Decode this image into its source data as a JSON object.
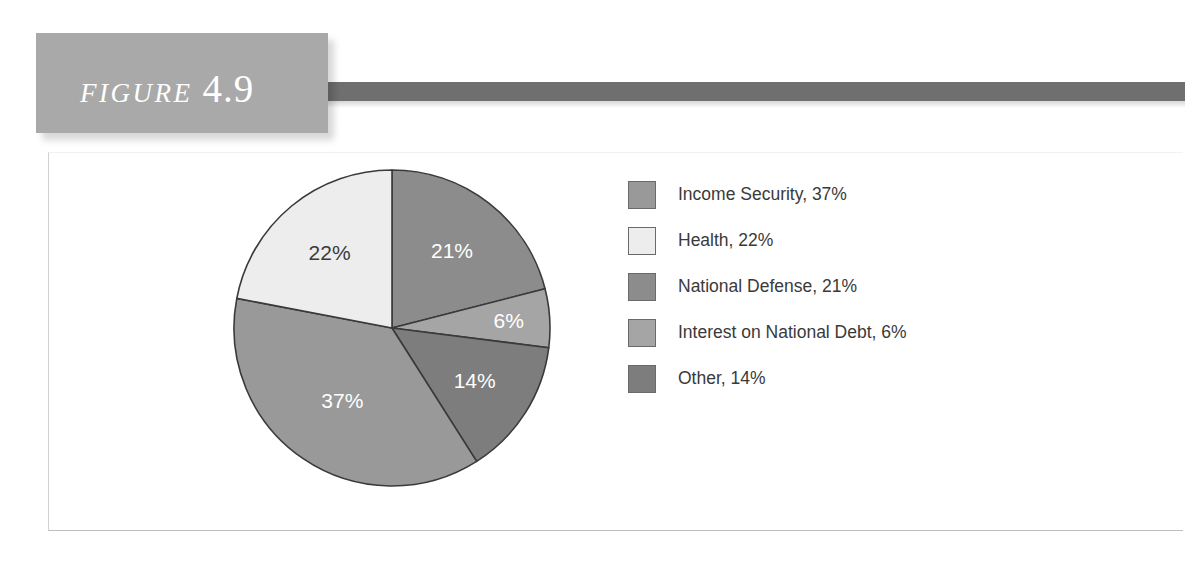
{
  "figure": {
    "word": "FIGURE",
    "number": "4.9"
  },
  "colors": {
    "header_box": "#a9a9a9",
    "accent_bar": "#6f6f6f",
    "income_security": "#999999",
    "health": "#ededed",
    "national_defense": "#8c8c8c",
    "interest_on_national_debt": "#a5a5a5",
    "other": "#7d7d7d",
    "slice_outline": "#3a3a3a",
    "legend_text": "#3a3a3a"
  },
  "legend": {
    "items": [
      {
        "label": "Income Security, 37%",
        "swatch": "#999999"
      },
      {
        "label": "Health, 22%",
        "swatch": "#ededed"
      },
      {
        "label": "National Defense, 21%",
        "swatch": "#8c8c8c"
      },
      {
        "label": "Interest on National Debt, 6%",
        "swatch": "#a5a5a5"
      },
      {
        "label": "Other, 14%",
        "swatch": "#7d7d7d"
      }
    ]
  },
  "chart_data": {
    "type": "pie",
    "title": "",
    "subtitle": "",
    "xlabel": "",
    "ylabel": "",
    "legend_position": "right",
    "grid": false,
    "start_angle_deg": 0,
    "direction": "clockwise",
    "units": "percent of federal budget",
    "categories": [
      "Income Security",
      "Health",
      "National Defense",
      "Interest on National Debt",
      "Other"
    ],
    "values": [
      37,
      22,
      21,
      6,
      14
    ],
    "slice_labels": [
      "37%",
      "22%",
      "21%",
      "6%",
      "14%"
    ],
    "slice_colors": [
      "#999999",
      "#ededed",
      "#8c8c8c",
      "#a5a5a5",
      "#7d7d7d"
    ],
    "draw_order": [
      {
        "name": "National Defense",
        "value": 21,
        "label": "21%",
        "color": "#8c8c8c",
        "label_fill": "light"
      },
      {
        "name": "Interest on National Debt",
        "value": 6,
        "label": "6%",
        "color": "#a5a5a5",
        "label_fill": "light"
      },
      {
        "name": "Other",
        "value": 14,
        "label": "14%",
        "color": "#7d7d7d",
        "label_fill": "light"
      },
      {
        "name": "Income Security",
        "value": 37,
        "label": "37%",
        "color": "#999999",
        "label_fill": "light"
      },
      {
        "name": "Health",
        "value": 22,
        "label": "22%",
        "color": "#ededed",
        "label_fill": "dark"
      }
    ]
  }
}
